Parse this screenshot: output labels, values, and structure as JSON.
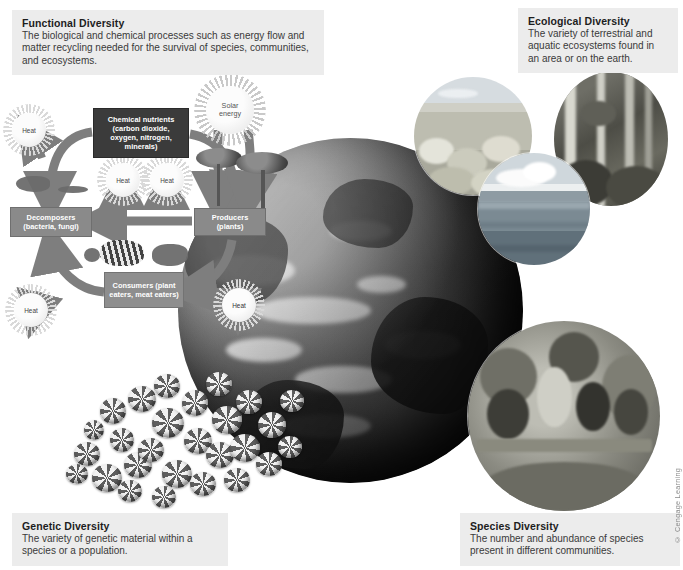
{
  "figure": {
    "title_concept": "Four components of biodiversity",
    "copyright": "© Cengage Learning"
  },
  "captions": {
    "functional": {
      "title": "Functional Diversity",
      "body": "The biological and chemical processes such as energy flow and matter recycling needed for the survival of species, communities, and ecosystems."
    },
    "ecological": {
      "title": "Ecological Diversity",
      "body": "The variety of terrestrial and aquatic ecosystems found in an area or on the earth."
    },
    "genetic": {
      "title": "Genetic Diversity",
      "body": "The variety of genetic material within a species or a population."
    },
    "species": {
      "title": "Species Diversity",
      "body": "The number and abundance of species present in different communities."
    }
  },
  "cycle": {
    "sun_label": "Solar\nenergy",
    "sun_label_line1": "Solar",
    "sun_label_line2": "energy",
    "nutrients": "Chemical nutrients (carbon dioxide, oxygen, nitrogen, minerals)",
    "decomposers": "Decomposers (bacteria, fungi)",
    "producers": "Producers (plants)",
    "consumers": "Consumers (plant eaters, meat eaters)",
    "heat_label": "Heat",
    "heat_count": 5
  },
  "photos": {
    "desert": "desert-scrubland-photo",
    "forest": "temperate-forest-photo",
    "ocean": "ocean-seascape-photo",
    "macaw": "macaws-on-branch-photo",
    "shells": "snail-shells-photo",
    "globe": "earth-globe-image"
  },
  "colors": {
    "caption_bg": "#ececec",
    "nutrient_box": "#3b3b3b",
    "trophic_box": "#8a8a8a",
    "arrow": "#7e7e7e",
    "page_bg": "#ffffff"
  }
}
